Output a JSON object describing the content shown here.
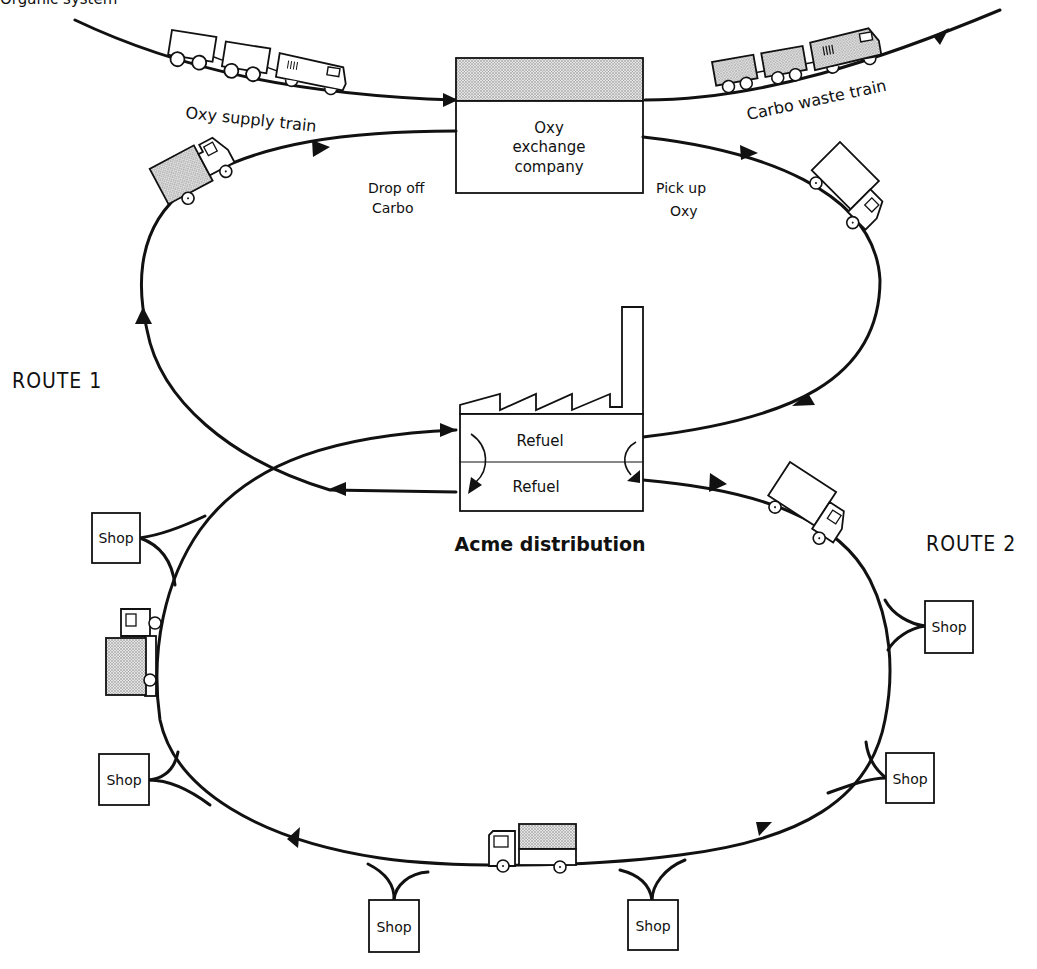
{
  "top_caption_partial": "Organic system",
  "trains": {
    "supply": {
      "label": "Oxy supply train",
      "cargo": "empty"
    },
    "waste": {
      "label": "Carbo waste train",
      "cargo": "shaded"
    }
  },
  "exchange": {
    "name_line1": "Oxy",
    "name_line2": "exchange",
    "name_line3": "company",
    "drop_off_line1": "Drop off",
    "drop_off_line2": "Carbo",
    "pick_up_line1": "Pick up",
    "pick_up_line2": "Oxy"
  },
  "distribution": {
    "name": "Acme distribution",
    "refuel_upper": "Refuel",
    "refuel_lower": "Refuel"
  },
  "routes": {
    "route1": "ROUTE 1",
    "route2": "ROUTE 2"
  },
  "shops": [
    {
      "label": "Shop",
      "position": "left-upper"
    },
    {
      "label": "Shop",
      "position": "left-lower"
    },
    {
      "label": "Shop",
      "position": "bottom-left"
    },
    {
      "label": "Shop",
      "position": "bottom-right"
    },
    {
      "label": "Shop",
      "position": "right-lower"
    },
    {
      "label": "Shop",
      "position": "right-upper"
    }
  ],
  "colors": {
    "ink": "#111111",
    "paper": "#ffffff",
    "shade": "#bdbdbd"
  }
}
